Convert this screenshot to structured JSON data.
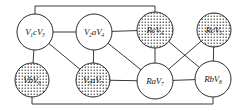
{
  "diagram": {
    "background_color": "#ffffff",
    "edge_color": "#3a3a3a",
    "node_stroke_color": "#2b2b2b",
    "node_plain_fill": "#ffffff",
    "node_shaded_pattern": "stipple-dots",
    "nodes": [
      {
        "id": "n1",
        "prefix": "V",
        "sub1": "1",
        "mid": "c",
        "suffix": "V",
        "sub2": "3",
        "label": "V1cV3",
        "cx": 35,
        "cy": 32,
        "r": 18,
        "shaded": false
      },
      {
        "id": "n2",
        "prefix": "V",
        "sub1": "2",
        "mid": "a",
        "suffix": "V",
        "sub2": "4",
        "label": "V2aV4",
        "cx": 94,
        "cy": 32,
        "r": 18,
        "shaded": false
      },
      {
        "id": "n3",
        "prefix": "R",
        "sub1": "",
        "mid": "c",
        "suffix": "V",
        "sub2": "4",
        "label": "RcV4",
        "cx": 155,
        "cy": 30,
        "r": 18,
        "shaded": true
      },
      {
        "id": "n4",
        "prefix": "R",
        "sub1": "",
        "mid": "c",
        "suffix": "V",
        "sub2": "5",
        "label": "RcV5",
        "cx": 214,
        "cy": 30,
        "r": 17,
        "shaded": true
      },
      {
        "id": "n5",
        "prefix": "V",
        "sub1": "",
        "mid": "b",
        "suffix": "V",
        "sub2": "6",
        "label": "VbV6",
        "cx": 32,
        "cy": 80,
        "r": 17,
        "shaded": true
      },
      {
        "id": "n6",
        "prefix": "V",
        "sub1": "5",
        "mid": "a",
        "suffix": "V",
        "sub2": "7",
        "label": "V5aV7",
        "cx": 93,
        "cy": 80,
        "r": 17,
        "shaded": true
      },
      {
        "id": "n7",
        "prefix": "R",
        "sub1": "",
        "mid": "a",
        "suffix": "V",
        "sub2": "7",
        "label": "RaV7",
        "cx": 155,
        "cy": 81,
        "r": 18,
        "shaded": false
      },
      {
        "id": "n8",
        "prefix": "R",
        "sub1": "",
        "mid": "b",
        "suffix": "V",
        "sub2": "8",
        "label": "RbV8",
        "cx": 213,
        "cy": 79,
        "r": 18,
        "shaded": false
      }
    ],
    "edges": [
      {
        "id": "e1",
        "from": "n1",
        "to": "n2",
        "kind": "straight"
      },
      {
        "id": "e2",
        "from": "n2",
        "to": "n3",
        "kind": "straight"
      },
      {
        "id": "e3",
        "from": "n1",
        "to": "n5",
        "kind": "straight"
      },
      {
        "id": "e4",
        "from": "n1",
        "to": "n6",
        "kind": "straight"
      },
      {
        "id": "e5",
        "from": "n2",
        "to": "n6",
        "kind": "straight"
      },
      {
        "id": "e6",
        "from": "n2",
        "to": "n7",
        "kind": "straight"
      },
      {
        "id": "e7",
        "from": "n3",
        "to": "n7",
        "kind": "straight"
      },
      {
        "id": "e8",
        "from": "n3",
        "to": "n8",
        "kind": "straight"
      },
      {
        "id": "e9",
        "from": "n4",
        "to": "n7",
        "kind": "straight"
      },
      {
        "id": "e10",
        "from": "n4",
        "to": "n8",
        "kind": "straight"
      },
      {
        "id": "e11",
        "from": "n6",
        "to": "n7",
        "kind": "straight"
      },
      {
        "id": "e12",
        "from": "n7",
        "to": "n8",
        "kind": "straight"
      },
      {
        "id": "e13",
        "from": "n1",
        "to": "n3",
        "kind": "routed-top",
        "path": "M 35 14 L 35 6 L 155 6 L 155 12"
      },
      {
        "id": "e14",
        "from": "n5",
        "to": "n8",
        "kind": "routed-bottom",
        "path": "M 32 97 L 32 104 L 213 104 L 213 97"
      }
    ]
  }
}
